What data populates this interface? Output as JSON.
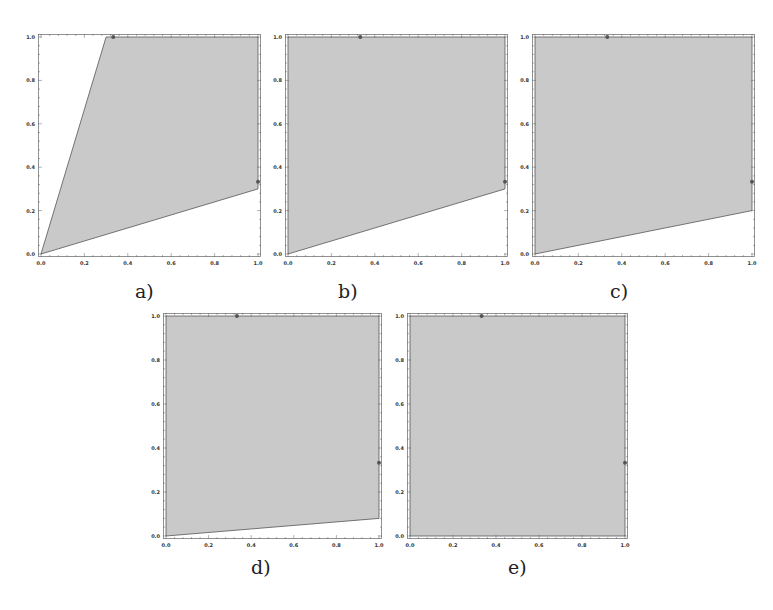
{
  "figure": {
    "panel_labels": [
      "a)",
      "b)",
      "c)",
      "d)",
      "e)"
    ]
  },
  "style": {
    "fill_color": "#c9c9c9",
    "edge_color": "#555555",
    "frame_color": "#777777",
    "point_color": "#555555"
  },
  "chart_data": [
    {
      "type": "area",
      "panel": "a)",
      "title": "",
      "xlabel": "",
      "ylabel": "",
      "xlim": [
        0,
        1
      ],
      "ylim": [
        0,
        1
      ],
      "xticks": [
        "0.0",
        "0.2",
        "0.4",
        "0.6",
        "0.8",
        "1.0"
      ],
      "yticks": [
        "0.0",
        "0.2",
        "0.4",
        "0.6",
        "0.8",
        "1.0"
      ],
      "grid": false,
      "polygon": [
        [
          0,
          0
        ],
        [
          0.3,
          1
        ],
        [
          1,
          1
        ],
        [
          1,
          0.3
        ]
      ],
      "points": [
        [
          0.333,
          1.0
        ],
        [
          1.0,
          0.333
        ]
      ]
    },
    {
      "type": "area",
      "panel": "b)",
      "title": "",
      "xlabel": "",
      "ylabel": "",
      "xlim": [
        0,
        1
      ],
      "ylim": [
        0,
        1
      ],
      "xticks": [
        "0.0",
        "0.2",
        "0.4",
        "0.6",
        "0.8",
        "1.0"
      ],
      "yticks": [
        "0.0",
        "0.2",
        "0.4",
        "0.6",
        "0.8",
        "1.0"
      ],
      "grid": false,
      "polygon": [
        [
          0,
          0
        ],
        [
          0,
          1
        ],
        [
          1,
          1
        ],
        [
          1,
          0.3
        ]
      ],
      "points": [
        [
          0.333,
          1.0
        ],
        [
          1.0,
          0.333
        ]
      ]
    },
    {
      "type": "area",
      "panel": "c)",
      "title": "",
      "xlabel": "",
      "ylabel": "",
      "xlim": [
        0,
        1
      ],
      "ylim": [
        0,
        1
      ],
      "xticks": [
        "0.0",
        "0.2",
        "0.4",
        "0.6",
        "0.8",
        "1.0"
      ],
      "yticks": [
        "0.0",
        "0.2",
        "0.4",
        "0.6",
        "0.8",
        "1.0"
      ],
      "grid": false,
      "polygon": [
        [
          0,
          0
        ],
        [
          0,
          1
        ],
        [
          1,
          1
        ],
        [
          1,
          0.2
        ]
      ],
      "points": [
        [
          0.333,
          1.0
        ],
        [
          1.0,
          0.333
        ]
      ]
    },
    {
      "type": "area",
      "panel": "d)",
      "title": "",
      "xlabel": "",
      "ylabel": "",
      "xlim": [
        0,
        1
      ],
      "ylim": [
        0,
        1
      ],
      "xticks": [
        "0.0",
        "0.2",
        "0.4",
        "0.6",
        "0.8",
        "1.0"
      ],
      "yticks": [
        "0.0",
        "0.2",
        "0.4",
        "0.6",
        "0.8",
        "1.0"
      ],
      "grid": false,
      "polygon": [
        [
          0,
          0
        ],
        [
          0,
          1
        ],
        [
          1,
          1
        ],
        [
          1,
          0.08
        ]
      ],
      "points": [
        [
          0.333,
          1.0
        ],
        [
          1.0,
          0.333
        ]
      ]
    },
    {
      "type": "area",
      "panel": "e)",
      "title": "",
      "xlabel": "",
      "ylabel": "",
      "xlim": [
        0,
        1
      ],
      "ylim": [
        0,
        1
      ],
      "xticks": [
        "0.0",
        "0.2",
        "0.4",
        "0.6",
        "0.8",
        "1.0"
      ],
      "yticks": [
        "0.0",
        "0.2",
        "0.4",
        "0.6",
        "0.8",
        "1.0"
      ],
      "grid": false,
      "polygon": [
        [
          0,
          0
        ],
        [
          0,
          1
        ],
        [
          1,
          1
        ],
        [
          1,
          0
        ]
      ],
      "points": [
        [
          0.333,
          1.0
        ],
        [
          1.0,
          0.333
        ]
      ]
    }
  ]
}
